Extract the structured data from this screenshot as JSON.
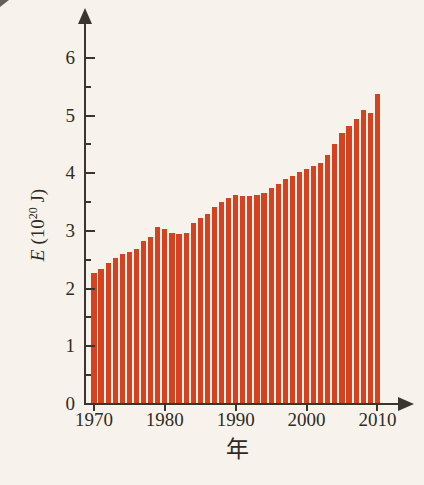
{
  "chart_data": {
    "type": "bar",
    "title": "",
    "x": [
      1970,
      1971,
      1972,
      1973,
      1974,
      1975,
      1976,
      1977,
      1978,
      1979,
      1980,
      1981,
      1982,
      1983,
      1984,
      1985,
      1986,
      1987,
      1988,
      1989,
      1990,
      1991,
      1992,
      1993,
      1994,
      1995,
      1996,
      1997,
      1998,
      1999,
      2000,
      2001,
      2002,
      2003,
      2004,
      2005,
      2006,
      2007,
      2008,
      2009,
      2010
    ],
    "values": [
      2.28,
      2.34,
      2.45,
      2.53,
      2.6,
      2.64,
      2.68,
      2.82,
      2.9,
      3.07,
      3.03,
      2.97,
      2.94,
      2.97,
      3.14,
      3.23,
      3.3,
      3.41,
      3.5,
      3.58,
      3.62,
      3.61,
      3.6,
      3.62,
      3.66,
      3.74,
      3.82,
      3.9,
      3.96,
      4.02,
      4.08,
      4.12,
      4.18,
      4.32,
      4.5,
      4.7,
      4.82,
      4.95,
      5.1,
      5.05,
      5.38
    ],
    "xlabel": "年",
    "ylabel": {
      "var": "E",
      "unit_pre": "(10",
      "unit_sup": "20",
      "unit_post": " J)",
      "text": "E (10²⁰ J)"
    },
    "ylim": [
      0,
      6.5
    ],
    "y_major_ticks": [
      0,
      1,
      2,
      3,
      4,
      5,
      6
    ],
    "y_minor_step": 0.5,
    "x_ticks": [
      1970,
      1980,
      1990,
      2000,
      2010
    ],
    "bar_color": "#d6421f",
    "axis_color": "#3a362f",
    "background_color": "#f7f3ec",
    "grid": false,
    "legend": false
  }
}
